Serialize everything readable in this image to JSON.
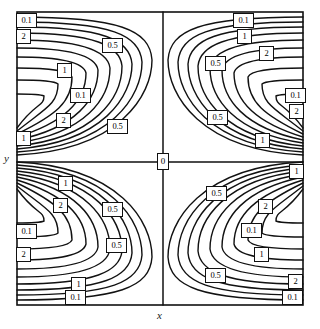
{
  "figure": {
    "kind": "contour-plot",
    "axis_x_label": "x",
    "axis_y_label": "y",
    "origin_label": "0",
    "frame": {
      "left": 17,
      "top": 12,
      "right": 303,
      "bottom": 305
    },
    "center": {
      "x": 163,
      "y": 162
    },
    "stroke_color": "#111111",
    "background_color": "#ffffff",
    "label_box_border_color": "#111111"
  },
  "chart_data": {
    "type": "line",
    "title": "",
    "xlabel": "x",
    "ylabel": "y",
    "grid": false,
    "legend": null,
    "contour_levels": [
      0.1,
      0.5,
      1,
      2
    ],
    "axis_lines": {
      "vertical_at_x": 0,
      "horizontal_at_y": 0
    },
    "quadrants": [
      {
        "name": "upper-left",
        "levels": [
          0.1,
          2,
          0.5,
          1
        ],
        "opening_direction": "right"
      },
      {
        "name": "upper-right",
        "levels": [
          0.1,
          1,
          0.5,
          2
        ],
        "opening_direction": "left"
      },
      {
        "name": "lower-left",
        "levels": [
          1,
          2,
          0.5,
          0.1
        ],
        "opening_direction": "right"
      },
      {
        "name": "lower-right",
        "levels": [
          1,
          0.5,
          2,
          0.1
        ],
        "opening_direction": "left"
      }
    ],
    "labels": [
      {
        "id": "l01",
        "text": "0.1",
        "x": 16,
        "y": 13,
        "size": "w"
      },
      {
        "id": "l02",
        "text": "2",
        "x": 16,
        "y": 29,
        "size": "n"
      },
      {
        "id": "l03",
        "text": "0.5",
        "x": 102,
        "y": 38,
        "size": "w"
      },
      {
        "id": "l04",
        "text": "1",
        "x": 57,
        "y": 63,
        "size": "n"
      },
      {
        "id": "l05",
        "text": "0.1",
        "x": 70,
        "y": 88,
        "size": "w"
      },
      {
        "id": "l06",
        "text": "2",
        "x": 56,
        "y": 113,
        "size": "n"
      },
      {
        "id": "l07",
        "text": "0.5",
        "x": 107,
        "y": 119,
        "size": "w"
      },
      {
        "id": "l08",
        "text": "1",
        "x": 16,
        "y": 131,
        "size": "n"
      },
      {
        "id": "l09",
        "text": "0.1",
        "x": 233,
        "y": 13,
        "size": "w"
      },
      {
        "id": "l10",
        "text": "1",
        "x": 237,
        "y": 29,
        "size": "n"
      },
      {
        "id": "l11",
        "text": "2",
        "x": 259,
        "y": 46,
        "size": "n"
      },
      {
        "id": "l12",
        "text": "0.5",
        "x": 205,
        "y": 56,
        "size": "w"
      },
      {
        "id": "l13",
        "text": "0.1",
        "x": 285,
        "y": 88,
        "size": "w"
      },
      {
        "id": "l14",
        "text": "2",
        "x": 289,
        "y": 104,
        "size": "n"
      },
      {
        "id": "l15",
        "text": "0.5",
        "x": 207,
        "y": 110,
        "size": "w"
      },
      {
        "id": "l16",
        "text": "1",
        "x": 255,
        "y": 133,
        "size": "n"
      },
      {
        "id": "l17",
        "text": "0",
        "x": 157,
        "y": 153,
        "size": "z"
      },
      {
        "id": "l18",
        "text": "1",
        "x": 289,
        "y": 164,
        "size": "n"
      },
      {
        "id": "l19",
        "text": "1",
        "x": 58,
        "y": 176,
        "size": "n"
      },
      {
        "id": "l20",
        "text": "2",
        "x": 53,
        "y": 198,
        "size": "n"
      },
      {
        "id": "l21",
        "text": "0.5",
        "x": 102,
        "y": 202,
        "size": "w"
      },
      {
        "id": "l22",
        "text": "0.5",
        "x": 206,
        "y": 186,
        "size": "w"
      },
      {
        "id": "l23",
        "text": "2",
        "x": 258,
        "y": 199,
        "size": "n"
      },
      {
        "id": "l24",
        "text": "0.1",
        "x": 16,
        "y": 224,
        "size": "w"
      },
      {
        "id": "l25",
        "text": "0.1",
        "x": 241,
        "y": 223,
        "size": "w"
      },
      {
        "id": "l26",
        "text": "2",
        "x": 16,
        "y": 247,
        "size": "n"
      },
      {
        "id": "l27",
        "text": "0.5",
        "x": 106,
        "y": 238,
        "size": "w"
      },
      {
        "id": "l28",
        "text": "1",
        "x": 254,
        "y": 247,
        "size": "n"
      },
      {
        "id": "l29",
        "text": "0.5",
        "x": 205,
        "y": 268,
        "size": "w"
      },
      {
        "id": "l30",
        "text": "1",
        "x": 71,
        "y": 277,
        "size": "n"
      },
      {
        "id": "l31",
        "text": "2",
        "x": 288,
        "y": 274,
        "size": "n"
      },
      {
        "id": "l32",
        "text": "0.1",
        "x": 65,
        "y": 290,
        "size": "w"
      },
      {
        "id": "l33",
        "text": "0.1",
        "x": 282,
        "y": 290,
        "size": "w"
      }
    ]
  }
}
